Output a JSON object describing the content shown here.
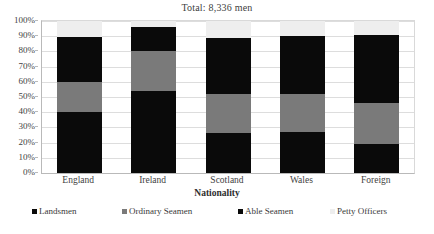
{
  "chart_data": {
    "type": "bar",
    "subtype": "stacked-percent",
    "title": "Total: 8,336 men",
    "xlabel": "Nationality",
    "ylabel": "",
    "categories": [
      "England",
      "Ireland",
      "Scotland",
      "Wales",
      "Foreign"
    ],
    "ylim": [
      0,
      100
    ],
    "ytick_labels": [
      "0%",
      "10%",
      "20%",
      "30%",
      "40%",
      "50%",
      "60%",
      "70%",
      "80%",
      "90%",
      "100%"
    ],
    "ytick_values": [
      0,
      10,
      20,
      30,
      40,
      50,
      60,
      70,
      80,
      90,
      100
    ],
    "grid": true,
    "legend_position": "bottom",
    "series": [
      {
        "name": "Landsmen",
        "color": "#0a0a0a",
        "values": [
          40,
          54,
          26,
          27,
          19
        ]
      },
      {
        "name": "Ordinary Seamen",
        "color": "#7a7a7a",
        "values": [
          20,
          26,
          26,
          25,
          27
        ]
      },
      {
        "name": "Able Seamen",
        "color": "#0a0a0a",
        "values": [
          29.5,
          16,
          37,
          38,
          45
        ]
      },
      {
        "name": "Petty Officers",
        "color": "#eeeeee",
        "values": [
          10.5,
          4,
          11,
          10,
          9
        ]
      }
    ]
  },
  "chart": {
    "title": "Total: 8,336 men",
    "xaxis_title": "Nationality",
    "plot_bg": "#ffffff",
    "grid_color": "#dddddd",
    "axis_color": "#b9b9b9"
  },
  "bottom_caption": ""
}
